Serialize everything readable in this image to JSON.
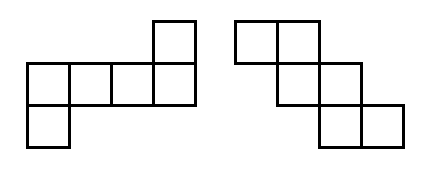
{
  "diagram": {
    "square_size": 45,
    "stroke_color": "#000000",
    "stroke_width": 3,
    "background": "#ffffff",
    "figures": [
      {
        "name": "net-left",
        "origin": [
          26,
          20
        ],
        "cells": [
          [
            3,
            0
          ],
          [
            0,
            1
          ],
          [
            1,
            1
          ],
          [
            2,
            1
          ],
          [
            3,
            1
          ],
          [
            0,
            2
          ]
        ]
      },
      {
        "name": "net-right",
        "origin": [
          234,
          20
        ],
        "cells": [
          [
            0,
            0
          ],
          [
            1,
            0
          ],
          [
            1,
            1
          ],
          [
            2,
            1
          ],
          [
            2,
            2
          ],
          [
            3,
            2
          ]
        ]
      }
    ]
  }
}
